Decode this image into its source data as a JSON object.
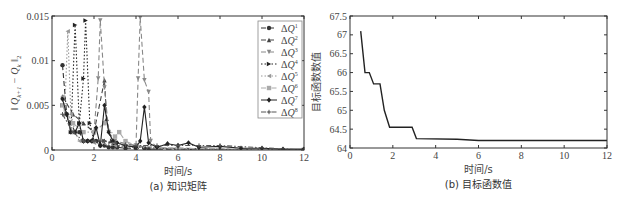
{
  "chart_data": [
    {
      "type": "line",
      "caption": "(a) 知识矩阵",
      "xlabel": "时间/s",
      "ylabel": "‖ Q_{k+1} − Q_k ‖₂",
      "xlim": [
        0,
        12
      ],
      "ylim": [
        0,
        0.015
      ],
      "xticks": [
        0,
        2,
        4,
        6,
        8,
        10,
        12
      ],
      "yticks": [
        0,
        0.005,
        0.01,
        0.015
      ],
      "ytick_labels": [
        "0",
        "0.005",
        "0.01",
        "0.015"
      ],
      "grid": false,
      "legend_position": "upper right",
      "series": [
        {
          "name": "ΔQ¹",
          "style": "dashed",
          "marker": "circle",
          "color": "#333333",
          "x": [
            0.5,
            0.7,
            0.9,
            1.1,
            1.3,
            1.5,
            1.7,
            1.9,
            2.1,
            2.3,
            2.5,
            2.7,
            2.9,
            3.1,
            3.5,
            4.0,
            4.4,
            4.6,
            5.0,
            6.0,
            8.0,
            10.0,
            12.0
          ],
          "y": [
            0.0095,
            0.004,
            0.003,
            0.002,
            0.002,
            0.001,
            0.001,
            0.001,
            0.001,
            0.0005,
            0.0005,
            0.0003,
            0.0003,
            0.0003,
            0.0002,
            0.0002,
            0.0002,
            0.0001,
            0.0001,
            0.0001,
            0,
            0,
            0
          ]
        },
        {
          "name": "ΔQ²",
          "style": "dashed",
          "marker": "triangle-up",
          "color": "#444444",
          "x": [
            0.5,
            1.0,
            1.5,
            2.0,
            2.5,
            2.6,
            2.8,
            3.0,
            4.0,
            5.0,
            6.0,
            8.0,
            12.0
          ],
          "y": [
            0.006,
            0.004,
            0.003,
            0.002,
            0.0078,
            0.0035,
            0.001,
            0.0005,
            0.0004,
            0.0002,
            0.0002,
            0.0001,
            0
          ]
        },
        {
          "name": "ΔQ³",
          "style": "dashed",
          "marker": "triangle-down",
          "color": "#888888",
          "x": [
            2.0,
            2.2,
            2.3,
            2.5,
            2.7,
            3.0,
            4.0,
            4.1,
            4.2,
            4.4,
            4.6,
            4.7,
            5.0,
            6.0,
            12.0
          ],
          "y": [
            0.002,
            0.008,
            0.0145,
            0.007,
            0.002,
            0.001,
            0.0005,
            0.008,
            0.0148,
            0.0078,
            0.0065,
            0.001,
            0.0003,
            0.0001,
            0
          ]
        },
        {
          "name": "ΔQ⁴",
          "style": "dotted",
          "marker": "triangle-right",
          "color": "#222222",
          "x": [
            0.5,
            0.7,
            0.9,
            1.1,
            1.3,
            1.5,
            1.6,
            1.8,
            2.0,
            2.5,
            3.0,
            4.0,
            5.0,
            6.0,
            12.0
          ],
          "y": [
            0.005,
            0.004,
            0.002,
            0.014,
            0.003,
            0.008,
            0.0145,
            0.003,
            0.001,
            0.001,
            0.0005,
            0.0003,
            0.0002,
            0.0001,
            0
          ]
        },
        {
          "name": "ΔQ⁵",
          "style": "dotted",
          "marker": "triangle-left",
          "color": "#999999",
          "x": [
            0.5,
            0.6,
            0.75,
            0.9,
            1.1,
            1.3,
            1.5,
            2.0,
            3.0,
            4.0,
            6.0,
            12.0
          ],
          "y": [
            0.006,
            0.004,
            0.0133,
            0.004,
            0.002,
            0.001,
            0.001,
            0.0008,
            0.0005,
            0.0003,
            0.0001,
            0
          ]
        },
        {
          "name": "ΔQ⁶",
          "style": "dash-dot",
          "marker": "square",
          "color": "#aaaaaa",
          "x": [
            0.5,
            1.0,
            1.5,
            2.0,
            2.5,
            3.0,
            3.2,
            3.5,
            4.0,
            5.0,
            6.0,
            12.0
          ],
          "y": [
            0.005,
            0.003,
            0.002,
            0.002,
            0.003,
            0.0015,
            0.002,
            0.001,
            0.0005,
            0.0003,
            0.0002,
            0
          ]
        },
        {
          "name": "ΔQ⁷",
          "style": "solid",
          "marker": "diamond",
          "color": "#222222",
          "x": [
            0.5,
            0.7,
            0.9,
            1.1,
            1.3,
            1.5,
            1.7,
            1.9,
            2.1,
            2.3,
            2.5,
            2.7,
            2.9,
            3.1,
            3.5,
            4.0,
            4.2,
            4.4,
            4.6,
            5.0,
            5.5,
            6.0,
            6.5,
            7.0,
            8.0,
            9.0,
            10.0,
            11.0,
            12.0
          ],
          "y": [
            0.0057,
            0.004,
            0.002,
            0.002,
            0.003,
            0.001,
            0.001,
            0.001,
            0.0025,
            0.0005,
            0.005,
            0.002,
            0.001,
            0.0008,
            0.0005,
            0.0003,
            0.001,
            0.0048,
            0.0008,
            0.0003,
            0.0007,
            0.0005,
            0.0008,
            0.0003,
            0.0004,
            0.0002,
            0.0002,
            0.0001,
            0.0001
          ]
        },
        {
          "name": "ΔQ⁸",
          "style": "dash-dot",
          "marker": "plus",
          "color": "#555555",
          "x": [
            0.5,
            1.0,
            1.5,
            2.0,
            2.5,
            3.0,
            3.5,
            4.0,
            5.0,
            6.0,
            7.0,
            8.0,
            12.0
          ],
          "y": [
            0.004,
            0.002,
            0.001,
            0.001,
            0.001,
            0.0008,
            0.0006,
            0.0005,
            0.0005,
            0.0005,
            0.0005,
            0.0005,
            0
          ]
        }
      ]
    },
    {
      "type": "line",
      "caption": "(b) 目标函数值",
      "xlabel": "时间/s",
      "ylabel": "目标函数数值",
      "xlim": [
        0,
        12
      ],
      "ylim": [
        64,
        67.5
      ],
      "xticks": [
        0,
        2,
        4,
        6,
        8,
        10,
        12
      ],
      "yticks": [
        64,
        64.5,
        65,
        65.5,
        66,
        66.5,
        67,
        67.5
      ],
      "grid": false,
      "series": [
        {
          "name": "目标函数值",
          "style": "solid",
          "color": "#222222",
          "x": [
            0.5,
            0.7,
            0.9,
            1.1,
            1.4,
            1.6,
            1.85,
            2.9,
            3.1,
            5.0,
            6.0,
            12.0
          ],
          "y": [
            67.1,
            66.0,
            66.0,
            65.7,
            65.7,
            65.0,
            64.55,
            64.55,
            64.25,
            64.23,
            64.2,
            64.2
          ]
        }
      ]
    }
  ],
  "labels": {
    "a": {
      "caption": "(a) 知识矩阵",
      "xlabel": "时间/s",
      "ylabel_main": "‖ Q",
      "ylabel_sub1": "k+1",
      "ylabel_mid": " − Q",
      "ylabel_sub2": "k",
      "ylabel_tail": " ‖",
      "ylabel_norm": "2"
    },
    "b": {
      "caption": "(b) 目标函数值",
      "xlabel": "时间/s",
      "ylabel": "目标函数数值"
    }
  }
}
